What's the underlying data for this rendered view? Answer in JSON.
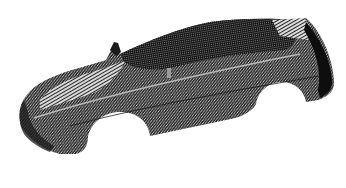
{
  "image": {
    "subject": "3D point-cloud mesh scan of a car body",
    "view": "three-quarter perspective, front facing left",
    "background_color": "#ffffff",
    "mesh_dark_color": "#1a1a1a",
    "mesh_mid_color": "#555555",
    "mesh_light_color": "#d0d0d0",
    "parts": [
      "hood",
      "windshield",
      "roof",
      "side-body",
      "front-wheel-arch",
      "rear-wheel-arch",
      "front-bumper",
      "rear-end",
      "side-mirror",
      "spoiler"
    ]
  }
}
